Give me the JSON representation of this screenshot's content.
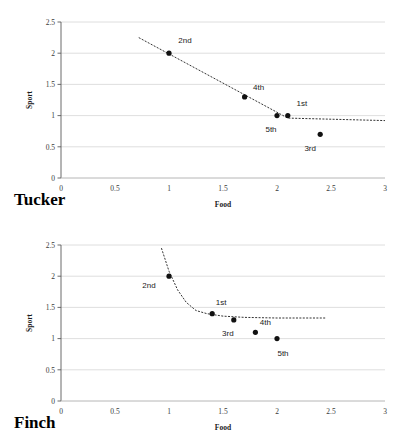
{
  "figure": {
    "panels": [
      {
        "key": "tucker",
        "title": "Tucker"
      },
      {
        "key": "finch",
        "title": "Finch"
      }
    ]
  },
  "chart_data": [
    {
      "type": "scatter",
      "title": "Tucker",
      "xlabel": "Food",
      "ylabel": "Sport",
      "xlim": [
        0,
        3
      ],
      "ylim": [
        0,
        2.5
      ],
      "xticks": [
        "0",
        "0.5",
        "1",
        "1.5",
        "2",
        "2.5",
        "3"
      ],
      "xtick_values": [
        0,
        0.5,
        1,
        1.5,
        2,
        2.5,
        3
      ],
      "yticks": [
        "0",
        "0.5",
        "1",
        "1.5",
        "2",
        "2.5"
      ],
      "ytick_values": [
        0,
        0.5,
        1,
        1.5,
        2,
        2.5
      ],
      "grid": "horizontal",
      "legend": "none",
      "points": [
        {
          "label": "2nd",
          "x": 1.0,
          "y": 2.0,
          "label_dx": 16,
          "label_dy": -10
        },
        {
          "label": "4th",
          "x": 1.7,
          "y": 1.3,
          "label_dx": 14,
          "label_dy": -7
        },
        {
          "label": "5th",
          "x": 2.0,
          "y": 1.0,
          "label_dx": -6,
          "label_dy": 16
        },
        {
          "label": "1st",
          "x": 2.1,
          "y": 1.0,
          "label_dx": 14,
          "label_dy": -10
        },
        {
          "label": "3rd",
          "x": 2.4,
          "y": 0.7,
          "label_dx": -10,
          "label_dy": 17
        }
      ],
      "trendline": {
        "style": "dashed",
        "shape": "linear-then-flat",
        "points": [
          {
            "x": 0.72,
            "y": 2.25
          },
          {
            "x": 2.1,
            "y": 0.96
          },
          {
            "x": 3.0,
            "y": 0.92
          }
        ]
      }
    },
    {
      "type": "scatter",
      "title": "Finch",
      "xlabel": "Food",
      "ylabel": "Sport",
      "xlim": [
        0,
        3
      ],
      "ylim": [
        0,
        2.5
      ],
      "xticks": [
        "0",
        "0.5",
        "1",
        "1.5",
        "2",
        "2.5",
        "3"
      ],
      "xtick_values": [
        0,
        0.5,
        1,
        1.5,
        2,
        2.5,
        3
      ],
      "yticks": [
        "0",
        "0.5",
        "1",
        "1.5",
        "2",
        "2.5"
      ],
      "ytick_values": [
        0,
        0.5,
        1,
        1.5,
        2,
        2.5
      ],
      "grid": "horizontal",
      "legend": "none",
      "points": [
        {
          "label": "2nd",
          "x": 1.0,
          "y": 2.0,
          "label_dx": -20,
          "label_dy": 12
        },
        {
          "label": "1st",
          "x": 1.4,
          "y": 1.4,
          "label_dx": 9,
          "label_dy": -9
        },
        {
          "label": "3rd",
          "x": 1.6,
          "y": 1.3,
          "label_dx": -6,
          "label_dy": 16
        },
        {
          "label": "4th",
          "x": 1.8,
          "y": 1.1,
          "label_dx": 10,
          "label_dy": -7
        },
        {
          "label": "5th",
          "x": 2.0,
          "y": 1.0,
          "label_dx": 6,
          "label_dy": 17
        }
      ],
      "trendline": {
        "style": "dashed",
        "shape": "exponential-decay",
        "asymptote": 1.32,
        "points": [
          {
            "x": 0.93,
            "y": 2.45
          },
          {
            "x": 1.0,
            "y": 2.08
          },
          {
            "x": 1.08,
            "y": 1.78
          },
          {
            "x": 1.16,
            "y": 1.58
          },
          {
            "x": 1.25,
            "y": 1.45
          },
          {
            "x": 1.35,
            "y": 1.4
          },
          {
            "x": 1.5,
            "y": 1.36
          },
          {
            "x": 1.7,
            "y": 1.34
          },
          {
            "x": 2.0,
            "y": 1.33
          },
          {
            "x": 2.45,
            "y": 1.33
          }
        ]
      }
    }
  ]
}
